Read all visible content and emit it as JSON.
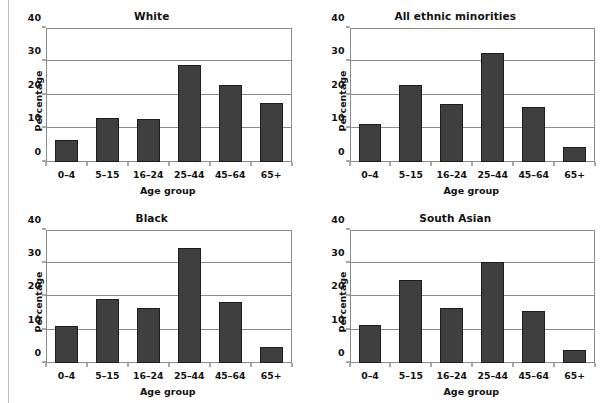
{
  "chart_data": {
    "type": "bar",
    "title": "",
    "xlabel": "Age group",
    "ylabel": "Percentage",
    "ylim": [
      0,
      40
    ],
    "yticks": [
      0,
      10,
      20,
      30,
      40
    ],
    "grid": true,
    "legend": "none",
    "categories": [
      "0–4",
      "5–15",
      "16–24",
      "25–44",
      "45–64",
      "65+"
    ],
    "panels": [
      {
        "title": "White",
        "values": [
          6.4,
          13.0,
          12.8,
          28.9,
          22.8,
          17.4
        ]
      },
      {
        "title": "All ethnic minorities",
        "values": [
          11.3,
          23.0,
          17.3,
          32.5,
          16.2,
          4.3
        ]
      },
      {
        "title": "Black",
        "values": [
          11.0,
          19.1,
          16.5,
          34.5,
          18.3,
          4.7
        ]
      },
      {
        "title": "South Asian",
        "values": [
          11.4,
          24.8,
          16.5,
          30.3,
          15.7,
          4.0
        ]
      }
    ]
  },
  "colors": {
    "bar_fill": "#3f3f3f",
    "bar_edge": "#1d1d1d",
    "axis": "#8c8c8c",
    "text": "#111111",
    "background": "#ffffff"
  }
}
